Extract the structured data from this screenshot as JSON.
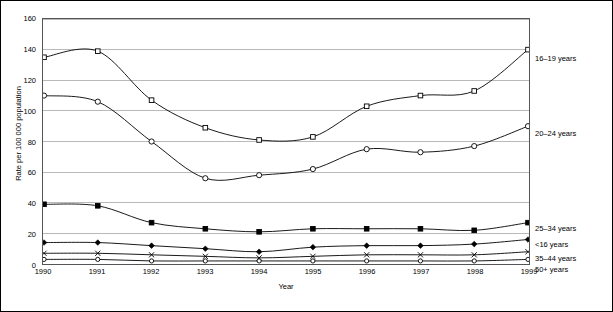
{
  "chart_data": {
    "type": "line",
    "title": "",
    "xlabel": "Year",
    "ylabel": "Rate per 100 000 population",
    "categories": [
      "1990",
      "1991",
      "1992",
      "1993",
      "1994",
      "1995",
      "1996",
      "1997",
      "1998",
      "1999"
    ],
    "xlim": [
      1990,
      1999
    ],
    "ylim": [
      0,
      160
    ],
    "yticks": [
      0,
      20,
      40,
      60,
      80,
      100,
      120,
      140,
      160
    ],
    "grid": "horizontal",
    "legend_position": "right-inline",
    "series": [
      {
        "name": "16–19 years",
        "marker": "open-square",
        "values": [
          135,
          139,
          107,
          89,
          81,
          83,
          103,
          110,
          113,
          140
        ]
      },
      {
        "name": "20–24 years",
        "marker": "open-circle",
        "values": [
          110,
          106,
          80,
          56,
          58,
          62,
          75,
          73,
          77,
          90
        ]
      },
      {
        "name": "25–34 years",
        "marker": "filled-square",
        "values": [
          39,
          38,
          27,
          23,
          21,
          23,
          23,
          23,
          22,
          27
        ]
      },
      {
        "name": "<16 years",
        "marker": "filled-diamond",
        "values": [
          14,
          14,
          12,
          10,
          8,
          11,
          12,
          12,
          13,
          16
        ]
      },
      {
        "name": "35–44 years",
        "marker": "cross",
        "values": [
          7,
          7,
          6,
          5,
          4,
          5,
          6,
          6,
          6,
          8
        ]
      },
      {
        "name": "50+ years",
        "marker": "open-circle-small",
        "values": [
          3,
          3,
          2,
          2,
          2,
          2,
          2,
          2,
          2,
          3
        ]
      }
    ]
  },
  "axis": {
    "ytitle": "Rate per 100 000 population",
    "xtitle": "Year",
    "yticks": [
      "0",
      "20",
      "40",
      "60",
      "80",
      "100",
      "120",
      "140",
      "160"
    ],
    "xticks": [
      "1990",
      "1991",
      "1992",
      "1993",
      "1994",
      "1995",
      "1996",
      "1997",
      "1998",
      "1999"
    ]
  },
  "legend": {
    "items": [
      {
        "label": "16–19 years"
      },
      {
        "label": "20–24 years"
      },
      {
        "label": "25–34 years"
      },
      {
        "label": "<16 years"
      },
      {
        "label": "35–44 years"
      },
      {
        "label": "50+ years"
      }
    ]
  }
}
